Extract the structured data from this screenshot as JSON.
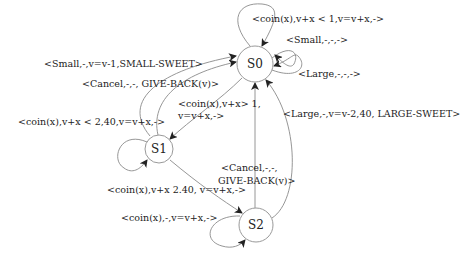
{
  "diagram": {
    "type": "finite-state-machine",
    "states": [
      {
        "id": "S0",
        "label": "S0"
      },
      {
        "id": "S1",
        "label": "S1"
      },
      {
        "id": "S2",
        "label": "S2"
      }
    ],
    "transitions": [
      {
        "from": "S0",
        "to": "S0",
        "label": "<coin(x),v+x < 1,v=v+x,->"
      },
      {
        "from": "S0",
        "to": "S0",
        "label": "<Small,-,-,->"
      },
      {
        "from": "S0",
        "to": "S0",
        "label": "<Large,-,-,->"
      },
      {
        "from": "S1",
        "to": "S0",
        "label": "<Small,-,v=v-1,SMALL-SWEET>"
      },
      {
        "from": "S1",
        "to": "S0",
        "label": "<Cancel,-,-, GIVE-BACK(v)>"
      },
      {
        "from": "S0",
        "to": "S1",
        "label_line1": "<coin(x),v+x> 1,",
        "label_line2": "v=v+x,->"
      },
      {
        "from": "S1",
        "to": "S1",
        "label": "<coin(x),v+x < 2,40,v=v+x,->"
      },
      {
        "from": "S1",
        "to": "S2",
        "label": "<coin(x),v+x  2.40, v=v+x,->"
      },
      {
        "from": "S2",
        "to": "S0",
        "label_line1": "<Cancel,-,-,",
        "label_line2": "GIVE-BACK(v)>"
      },
      {
        "from": "S2",
        "to": "S0",
        "label": "<Large,-,v=v-2,40, LARGE-SWEET>"
      },
      {
        "from": "S2",
        "to": "S2",
        "label": "<coin(x),-,v=v+x,->"
      }
    ]
  }
}
